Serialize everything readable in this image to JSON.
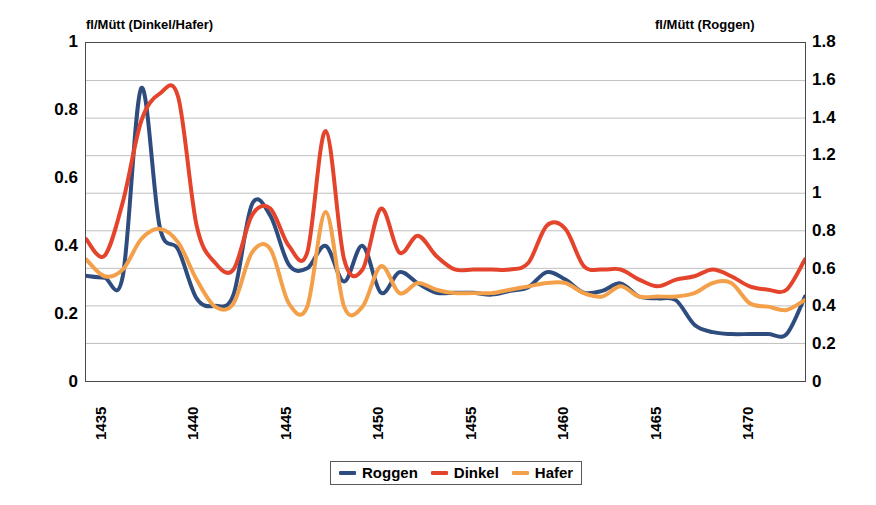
{
  "chart_data": {
    "type": "line",
    "title": "",
    "subtitle": "",
    "xlabel": "",
    "ylabel": "fl/Mütt (Dinkel/Hafer)",
    "y2label": "fl/Mütt (Roggen)",
    "grid": true,
    "legend_position": "bottom-center",
    "xlim": [
      1435,
      1474
    ],
    "ylim": [
      0,
      1
    ],
    "y2lim": [
      0,
      1.8
    ],
    "xticks": [
      "1435",
      "1440",
      "1445",
      "1450",
      "1455",
      "1460",
      "1465",
      "1470"
    ],
    "xtick_values": [
      1435,
      1440,
      1445,
      1450,
      1455,
      1460,
      1465,
      1470
    ],
    "yticks": [
      "0",
      "0.2",
      "0.4",
      "0.6",
      "0.8",
      "1"
    ],
    "ytick_values": [
      0,
      0.2,
      0.4,
      0.6,
      0.8,
      1
    ],
    "y2ticks": [
      "0",
      "0.2",
      "0.4",
      "0.6",
      "0.8",
      "1",
      "1.2",
      "1.4",
      "1.6",
      "1.8"
    ],
    "y2tick_values": [
      0,
      0.2,
      0.4,
      0.6,
      0.8,
      1.0,
      1.2,
      1.4,
      1.6,
      1.8
    ],
    "x": [
      1435,
      1436,
      1437,
      1438,
      1439,
      1440,
      1441,
      1442,
      1443,
      1444,
      1445,
      1446,
      1447,
      1448,
      1449,
      1450,
      1451,
      1452,
      1453,
      1454,
      1455,
      1456,
      1457,
      1458,
      1459,
      1460,
      1461,
      1462,
      1463,
      1464,
      1465,
      1466,
      1467,
      1468,
      1469,
      1470,
      1471,
      1472,
      1473,
      1474
    ],
    "series": [
      {
        "name": "Roggen",
        "axis": "right",
        "color": "#2E4C7E",
        "units": "fl/Mütt",
        "values": [
          0.56,
          0.55,
          0.56,
          1.56,
          0.82,
          0.7,
          0.44,
          0.4,
          0.46,
          0.94,
          0.88,
          0.62,
          0.6,
          0.72,
          0.53,
          0.72,
          0.47,
          0.58,
          0.52,
          0.47,
          0.47,
          0.47,
          0.46,
          0.48,
          0.5,
          0.58,
          0.54,
          0.47,
          0.48,
          0.52,
          0.45,
          0.44,
          0.43,
          0.3,
          0.26,
          0.25,
          0.25,
          0.25,
          0.25,
          0.45
        ]
      },
      {
        "name": "Dinkel",
        "axis": "left",
        "color": "#E5442C",
        "units": "fl/Mütt",
        "values": [
          0.42,
          0.37,
          0.53,
          0.77,
          0.85,
          0.84,
          0.46,
          0.35,
          0.33,
          0.49,
          0.51,
          0.4,
          0.38,
          0.74,
          0.36,
          0.33,
          0.51,
          0.38,
          0.43,
          0.37,
          0.33,
          0.33,
          0.33,
          0.33,
          0.35,
          0.46,
          0.45,
          0.34,
          0.33,
          0.33,
          0.3,
          0.28,
          0.3,
          0.31,
          0.33,
          0.31,
          0.28,
          0.27,
          0.27,
          0.36
        ]
      },
      {
        "name": "Hafer",
        "axis": "left",
        "color": "#F4A04A",
        "units": "fl/Mütt",
        "values": [
          0.36,
          0.31,
          0.33,
          0.42,
          0.45,
          0.41,
          0.3,
          0.22,
          0.23,
          0.38,
          0.39,
          0.23,
          0.22,
          0.5,
          0.22,
          0.22,
          0.34,
          0.26,
          0.29,
          0.27,
          0.26,
          0.26,
          0.26,
          0.27,
          0.28,
          0.29,
          0.29,
          0.26,
          0.25,
          0.28,
          0.25,
          0.25,
          0.25,
          0.26,
          0.29,
          0.29,
          0.23,
          0.22,
          0.21,
          0.24
        ]
      }
    ]
  },
  "legend": {
    "items": [
      {
        "label": "Roggen",
        "color": "#2E4C7E"
      },
      {
        "label": "Dinkel",
        "color": "#E5442C"
      },
      {
        "label": "Hafer",
        "color": "#F4A04A"
      }
    ]
  },
  "colors": {
    "roggen": "#2E4C7E",
    "dinkel": "#E5442C",
    "hafer": "#F4A04A",
    "grid": "#B0B0B0",
    "frame": "#4A4A4A",
    "background": "#FFFFFF"
  }
}
